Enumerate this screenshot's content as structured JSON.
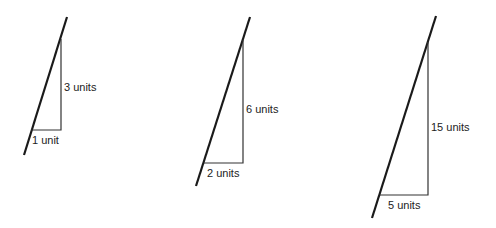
{
  "diagrams": [
    {
      "rise_label": "3 units",
      "run_label": "1 unit",
      "line": [
        67,
        17,
        24,
        155
      ],
      "triangle": {
        "top": [
          61,
          39
        ],
        "corner": [
          61,
          130
        ],
        "left": [
          31,
          130
        ]
      },
      "rise_pos": [
        64,
        81
      ],
      "run_pos": [
        32,
        134
      ]
    },
    {
      "rise_label": "6 units",
      "run_label": "2 units",
      "line": [
        250,
        17,
        196,
        186
      ],
      "triangle": {
        "top": [
          243,
          40
        ],
        "corner": [
          243,
          163
        ],
        "left": [
          204,
          163
        ]
      },
      "rise_pos": [
        246,
        103
      ],
      "run_pos": [
        207,
        167
      ]
    },
    {
      "rise_label": "15 units",
      "run_label": "5 units",
      "line": [
        436,
        16,
        372,
        218
      ],
      "triangle": {
        "top": [
          428,
          42
        ],
        "corner": [
          428,
          195
        ],
        "left": [
          380,
          195
        ]
      },
      "rise_pos": [
        431,
        121
      ],
      "run_pos": [
        388,
        199
      ]
    }
  ],
  "colors": {
    "line": "#1a1a1a",
    "triangle": "#333333",
    "background": "#ffffff"
  }
}
